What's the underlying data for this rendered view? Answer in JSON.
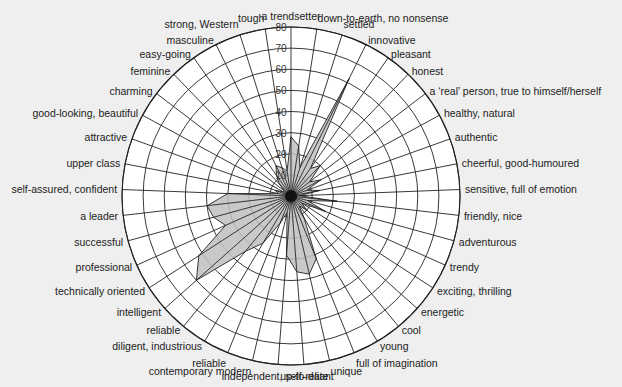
{
  "chart_data": {
    "type": "radar",
    "title": "",
    "center": [
      291,
      196
    ],
    "radial_axis": {
      "min": 0,
      "max": 80,
      "ticks": [
        10,
        20,
        30,
        40,
        50,
        60,
        70,
        80
      ]
    },
    "grid": true,
    "fill_color": "#c0c0c0",
    "stroke_color": "#222222",
    "categories": [
      "a trendsetter",
      "down-to-earth, no nonsense",
      "settled",
      "innovative",
      "pleasant",
      "honest",
      "a ‘real’ person, true to himself/herself",
      "healthy, natural",
      "authentic",
      "cheerful, good-humoured",
      "sensitive, full of emotion",
      "friendly, nice",
      "adventurous",
      "trendy",
      "exciting, thrilling",
      "energetic",
      "cool",
      "young",
      "full of imagination",
      "unique",
      "up-to-date",
      "independent, self-reliant",
      "contemporary modern",
      "reliable",
      "diligent, industrious",
      "reliable",
      "intelligent",
      "technically oriented",
      "professional",
      "successful",
      "a leader",
      "self-assured, confident",
      "upper class",
      "attractive",
      "good-looking, beautiful",
      "charming",
      "feminine",
      "easy-going",
      "masculine",
      "strong, Western",
      "tough"
    ],
    "values": [
      28,
      24,
      14,
      62,
      16,
      20,
      11,
      16,
      8,
      14,
      4,
      22,
      8,
      18,
      6,
      10,
      6,
      12,
      32,
      38,
      36,
      28,
      8,
      14,
      26,
      34,
      60,
      52,
      34,
      38,
      40,
      30,
      6,
      8,
      4,
      4,
      8,
      12,
      16,
      14,
      12
    ]
  }
}
